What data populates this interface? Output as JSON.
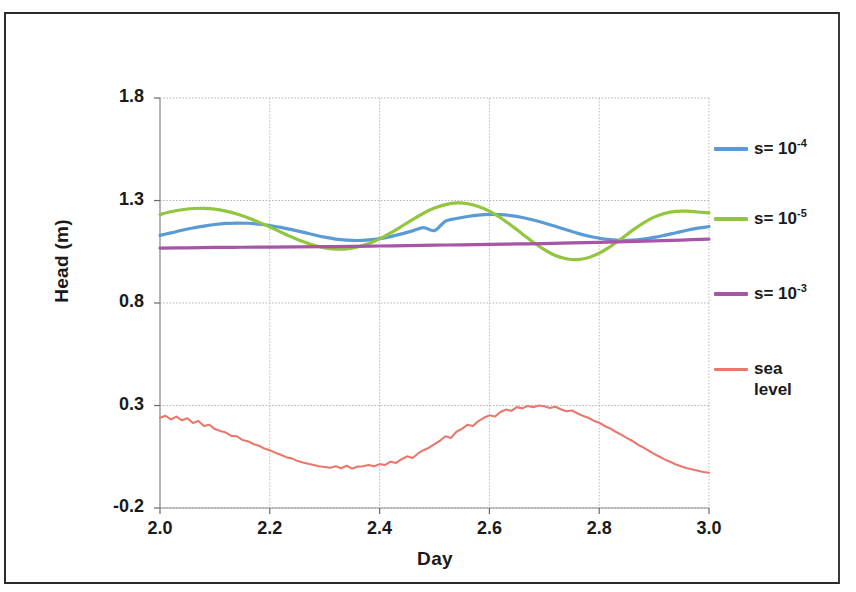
{
  "chart_data": {
    "type": "line",
    "title": "",
    "xlabel": "Day",
    "ylabel": "Head (m)",
    "xlim": [
      2.0,
      3.0
    ],
    "ylim": [
      -0.2,
      1.8
    ],
    "xticks": [
      "2.0",
      "2.2",
      "2.4",
      "2.6",
      "2.8",
      "3.0"
    ],
    "yticks": [
      "-0.2",
      "0.3",
      "0.8",
      "1.3",
      "1.8"
    ],
    "xtick_values": [
      2.0,
      2.2,
      2.4,
      2.6,
      2.8,
      3.0
    ],
    "ytick_values": [
      -0.2,
      0.3,
      0.8,
      1.3,
      1.8
    ],
    "grid": true,
    "legend_position": "right",
    "series": [
      {
        "name": "s=  10-4",
        "label_base": "s=  10",
        "label_exponent": "-4",
        "color": "#5B9BD5",
        "x": [
          2.0,
          2.02,
          2.04,
          2.06,
          2.08,
          2.1,
          2.12,
          2.14,
          2.16,
          2.18,
          2.2,
          2.22,
          2.24,
          2.26,
          2.28,
          2.3,
          2.32,
          2.34,
          2.36,
          2.38,
          2.4,
          2.42,
          2.44,
          2.46,
          2.48,
          2.5,
          2.52,
          2.54,
          2.56,
          2.58,
          2.6,
          2.62,
          2.64,
          2.66,
          2.68,
          2.7,
          2.72,
          2.74,
          2.76,
          2.78,
          2.8,
          2.82,
          2.84,
          2.86,
          2.88,
          2.9,
          2.92,
          2.94,
          2.96,
          2.98,
          3.0
        ],
        "y": [
          1.13,
          1.142,
          1.155,
          1.166,
          1.175,
          1.183,
          1.188,
          1.19,
          1.189,
          1.185,
          1.178,
          1.169,
          1.158,
          1.146,
          1.133,
          1.121,
          1.112,
          1.107,
          1.105,
          1.108,
          1.114,
          1.124,
          1.137,
          1.152,
          1.168,
          1.153,
          1.199,
          1.212,
          1.222,
          1.229,
          1.232,
          1.231,
          1.226,
          1.217,
          1.205,
          1.19,
          1.174,
          1.157,
          1.141,
          1.127,
          1.116,
          1.109,
          1.106,
          1.107,
          1.112,
          1.12,
          1.131,
          1.143,
          1.155,
          1.165,
          1.173
        ]
      },
      {
        "name": "s=  10-5",
        "label_base": "s=  10",
        "label_exponent": "-5",
        "color": "#92C63E",
        "x": [
          2.0,
          2.02,
          2.04,
          2.06,
          2.08,
          2.1,
          2.12,
          2.14,
          2.16,
          2.18,
          2.2,
          2.22,
          2.24,
          2.26,
          2.28,
          2.3,
          2.32,
          2.34,
          2.36,
          2.38,
          2.4,
          2.42,
          2.44,
          2.46,
          2.48,
          2.5,
          2.52,
          2.54,
          2.56,
          2.58,
          2.6,
          2.62,
          2.64,
          2.66,
          2.68,
          2.7,
          2.72,
          2.74,
          2.76,
          2.78,
          2.8,
          2.82,
          2.84,
          2.86,
          2.88,
          2.9,
          2.92,
          2.94,
          2.96,
          2.98,
          3.0
        ],
        "y": [
          1.232,
          1.245,
          1.255,
          1.261,
          1.262,
          1.258,
          1.248,
          1.234,
          1.216,
          1.194,
          1.171,
          1.146,
          1.122,
          1.1,
          1.082,
          1.069,
          1.063,
          1.064,
          1.073,
          1.09,
          1.113,
          1.142,
          1.174,
          1.207,
          1.238,
          1.263,
          1.28,
          1.288,
          1.285,
          1.271,
          1.248,
          1.216,
          1.178,
          1.137,
          1.096,
          1.06,
          1.032,
          1.016,
          1.012,
          1.021,
          1.043,
          1.075,
          1.113,
          1.153,
          1.19,
          1.219,
          1.238,
          1.247,
          1.248,
          1.244,
          1.24
        ]
      },
      {
        "name": "s=  10-3",
        "label_base": "s=  10",
        "label_exponent": "-3",
        "color": "#A855A8",
        "x": [
          2.0,
          2.05,
          2.1,
          2.15,
          2.2,
          2.25,
          2.3,
          2.35,
          2.4,
          2.45,
          2.5,
          2.55,
          2.6,
          2.65,
          2.7,
          2.75,
          2.8,
          2.85,
          2.9,
          2.95,
          3.0
        ],
        "y": [
          1.068,
          1.069,
          1.071,
          1.072,
          1.073,
          1.074,
          1.075,
          1.076,
          1.078,
          1.08,
          1.082,
          1.084,
          1.086,
          1.088,
          1.09,
          1.093,
          1.096,
          1.099,
          1.103,
          1.107,
          1.112
        ]
      },
      {
        "name": "sea level",
        "label_base": "sea\nlevel",
        "label_exponent": "",
        "color": "#E8786B",
        "x": [
          2.0,
          2.01,
          2.02,
          2.03,
          2.04,
          2.05,
          2.06,
          2.07,
          2.08,
          2.09,
          2.1,
          2.11,
          2.12,
          2.13,
          2.14,
          2.15,
          2.16,
          2.17,
          2.18,
          2.19,
          2.2,
          2.21,
          2.22,
          2.23,
          2.24,
          2.25,
          2.26,
          2.27,
          2.28,
          2.29,
          2.3,
          2.31,
          2.32,
          2.33,
          2.34,
          2.35,
          2.36,
          2.37,
          2.38,
          2.39,
          2.4,
          2.41,
          2.42,
          2.43,
          2.44,
          2.45,
          2.46,
          2.47,
          2.48,
          2.49,
          2.5,
          2.51,
          2.52,
          2.53,
          2.54,
          2.55,
          2.56,
          2.57,
          2.58,
          2.59,
          2.6,
          2.61,
          2.62,
          2.63,
          2.64,
          2.65,
          2.66,
          2.67,
          2.68,
          2.69,
          2.7,
          2.71,
          2.72,
          2.73,
          2.74,
          2.75,
          2.76,
          2.77,
          2.78,
          2.79,
          2.8,
          2.81,
          2.82,
          2.83,
          2.84,
          2.85,
          2.86,
          2.87,
          2.88,
          2.89,
          2.9,
          2.91,
          2.92,
          2.93,
          2.94,
          2.95,
          2.96,
          2.97,
          2.98,
          2.99,
          3.0
        ],
        "y": [
          0.24,
          0.25,
          0.232,
          0.246,
          0.228,
          0.238,
          0.215,
          0.224,
          0.2,
          0.206,
          0.185,
          0.176,
          0.168,
          0.152,
          0.15,
          0.132,
          0.126,
          0.112,
          0.104,
          0.09,
          0.082,
          0.07,
          0.06,
          0.048,
          0.042,
          0.03,
          0.022,
          0.016,
          0.01,
          0.004,
          0.0,
          -0.004,
          0.004,
          -0.006,
          0.006,
          -0.008,
          0.002,
          0.004,
          0.01,
          0.004,
          0.014,
          0.01,
          0.026,
          0.02,
          0.038,
          0.052,
          0.044,
          0.066,
          0.082,
          0.094,
          0.112,
          0.128,
          0.15,
          0.142,
          0.172,
          0.186,
          0.206,
          0.2,
          0.224,
          0.24,
          0.252,
          0.246,
          0.268,
          0.28,
          0.274,
          0.292,
          0.286,
          0.298,
          0.292,
          0.3,
          0.296,
          0.288,
          0.294,
          0.282,
          0.272,
          0.276,
          0.262,
          0.25,
          0.24,
          0.226,
          0.216,
          0.2,
          0.188,
          0.172,
          0.158,
          0.142,
          0.128,
          0.11,
          0.096,
          0.08,
          0.064,
          0.05,
          0.036,
          0.024,
          0.012,
          0.002,
          -0.006,
          -0.012,
          -0.018,
          -0.024,
          -0.028
        ]
      }
    ]
  },
  "legend": {
    "entries": [
      {
        "label_base": "s=  10",
        "exponent": "-4",
        "color": "#5B9BD5"
      },
      {
        "label_base": "s=  10",
        "exponent": "-5",
        "color": "#92C63E"
      },
      {
        "label_base": "s=  10",
        "exponent": "-3",
        "color": "#A855A8"
      },
      {
        "label_base": "sea\nlevel",
        "exponent": "",
        "color": "#E8786B"
      }
    ]
  }
}
